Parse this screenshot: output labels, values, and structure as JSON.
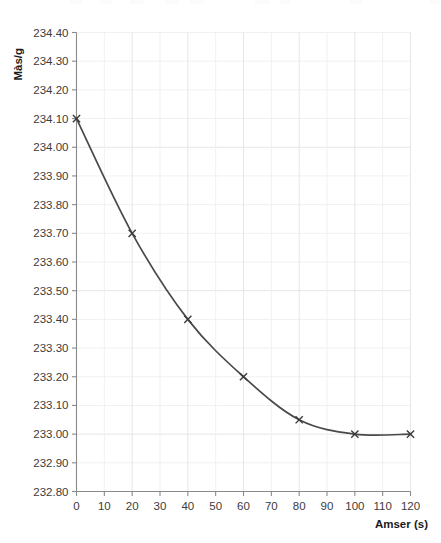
{
  "chart_data": {
    "type": "line",
    "title": "",
    "subtitle": "",
    "xlabel": "Amser (s)",
    "ylabel": "Màs/g",
    "xlim": [
      0,
      120
    ],
    "ylim": [
      232.8,
      234.4
    ],
    "xticks": [
      0,
      10,
      20,
      30,
      40,
      50,
      60,
      70,
      80,
      90,
      100,
      110,
      120
    ],
    "xtick_labels": [
      "0",
      "10",
      "20",
      "30",
      "40",
      "50",
      "60",
      "70",
      "80",
      "90",
      "100",
      "110",
      "120"
    ],
    "yticks": [
      232.8,
      232.9,
      233.0,
      233.1,
      233.2,
      233.3,
      233.4,
      233.5,
      233.6,
      233.7,
      233.8,
      233.9,
      234.0,
      234.1,
      234.2,
      234.3,
      234.4
    ],
    "ytick_labels": [
      "232.80",
      "232.90",
      "233.00",
      "233.10",
      "233.20",
      "233.30",
      "233.40",
      "233.50",
      "233.60",
      "233.70",
      "233.80",
      "233.90",
      "234.00",
      "234.10",
      "234.20",
      "234.30",
      "234.40"
    ],
    "grid": true,
    "grid_x_step": 10,
    "grid_y_step": 0.1,
    "legend": null,
    "legend_position": "none",
    "marker": "x",
    "line_color": "#4a4a4a",
    "marker_color": "#3a3a3a",
    "background_color": "#ffffff",
    "x": [
      0,
      20,
      40,
      60,
      80,
      100,
      120
    ],
    "values": [
      234.1,
      233.7,
      233.4,
      233.2,
      233.05,
      233.0,
      233.0
    ],
    "series": [
      {
        "name": "Màs",
        "x": [
          0,
          20,
          40,
          60,
          80,
          100,
          120
        ],
        "values": [
          234.1,
          233.7,
          233.4,
          233.2,
          233.05,
          233.0,
          233.0
        ]
      }
    ],
    "annotations": []
  },
  "axes": {
    "y_title": "Màs/g",
    "x_title": "Amser (s)"
  }
}
